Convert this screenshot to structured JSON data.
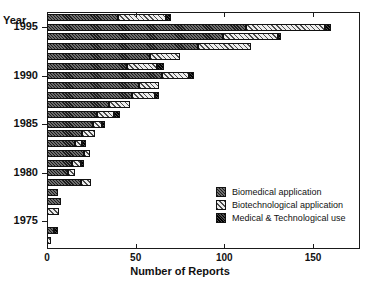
{
  "chart_data": {
    "type": "bar",
    "orientation": "horizontal",
    "stacked": true,
    "title": "",
    "xlabel": "Number of Reports",
    "ylabel": "Year",
    "xlim": [
      0,
      180
    ],
    "xticks": [
      0,
      50,
      100,
      150
    ],
    "xticklabels": [
      "0",
      "50",
      "100",
      "150"
    ],
    "yticklabels": [
      "1995",
      "1990",
      "1985",
      "1980",
      "1975"
    ],
    "grid": false,
    "legend_position": "lower-right",
    "categories": [
      1996,
      1995,
      1994,
      1993,
      1992,
      1991,
      1990,
      1989,
      1988,
      1987,
      1986,
      1985,
      1984,
      1983,
      1982,
      1981,
      1980,
      1979,
      1978,
      1977,
      1976,
      1975,
      1974,
      1973
    ],
    "series": [
      {
        "name": "Biomedical application",
        "key": "biomedical",
        "values": [
          40,
          112,
          99,
          85,
          58,
          45,
          65,
          52,
          48,
          35,
          28,
          26,
          20,
          16,
          21,
          14,
          12,
          19,
          6,
          8,
          0,
          0,
          4,
          0
        ]
      },
      {
        "name": "Biotechnological application",
        "key": "biotechnological",
        "values": [
          27,
          45,
          31,
          30,
          17,
          17,
          15,
          11,
          13,
          12,
          10,
          5,
          7,
          4,
          3,
          5,
          4,
          6,
          0,
          0,
          7,
          0,
          0,
          2
        ]
      },
      {
        "name": "Medical & Technological use",
        "key": "medical_technological",
        "values": [
          3,
          3,
          2,
          0,
          0,
          4,
          3,
          0,
          2,
          0,
          3,
          2,
          0,
          2,
          0,
          2,
          0,
          0,
          0,
          0,
          0,
          0,
          2,
          0
        ]
      }
    ],
    "legend": [
      {
        "label": "Biomedical application",
        "swatch": "seg-a"
      },
      {
        "label": "Biotechnological application",
        "swatch": "seg-b"
      },
      {
        "label": "Medical & Technological use",
        "swatch": "seg-c"
      }
    ],
    "colors": {
      "biomedical": "#5a5a5a",
      "biotechnological": "#e8e8e8",
      "medical_technological": "#2b2b2b",
      "axis": "#1a1a1a",
      "background": "#ffffff"
    }
  }
}
